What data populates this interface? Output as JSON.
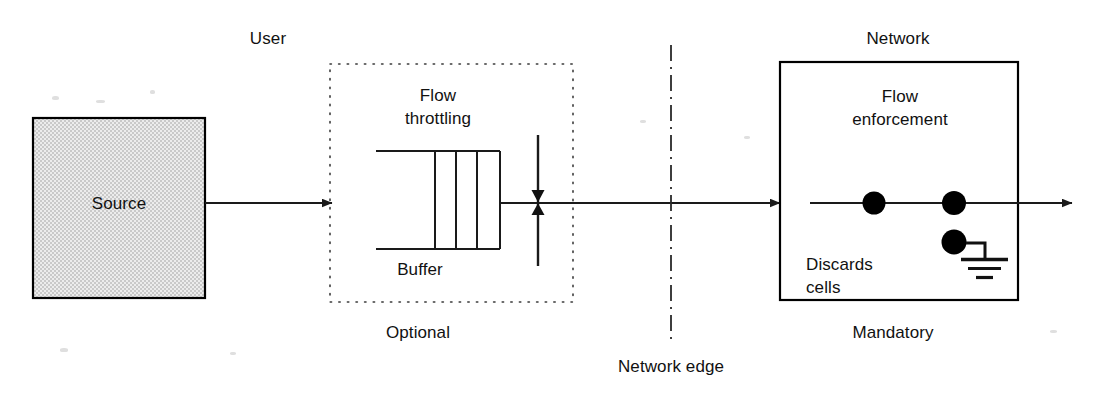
{
  "diagram": {
    "type": "block-flow-diagram",
    "colors": {
      "line": "#1a1a1a",
      "source_fill": "#d9d9d9",
      "source_border": "#000000",
      "cell_fill": "#000000",
      "background": "#ffffff"
    },
    "labels": {
      "user": "User",
      "network": "Network",
      "source": "Source",
      "flow_throttling": "Flow\nthrottling",
      "flow_throttling_line1": "Flow",
      "flow_throttling_line2": "throttling",
      "buffer": "Buffer",
      "optional": "Optional",
      "network_edge": "Network edge",
      "flow_enforcement_line1": "Flow",
      "flow_enforcement_line2": "enforcement",
      "discards_line1": "Discards",
      "discards_line2": "cells",
      "mandatory": "Mandatory"
    },
    "regions": [
      {
        "name": "user-region",
        "header": "User",
        "footer": "Optional",
        "border_style": "dotted",
        "contains": [
          "Flow throttling",
          "Buffer",
          "valve"
        ]
      },
      {
        "name": "network-region",
        "header": "Network",
        "footer": "Mandatory",
        "border_style": "solid",
        "contains": [
          "Flow enforcement",
          "Discards cells",
          "cells",
          "ground"
        ]
      }
    ],
    "buffer": {
      "cell_count": 3,
      "label": "Buffer"
    },
    "network_cells": {
      "on_line_count": 2,
      "discarded_count": 1
    },
    "icons": {
      "valve": "valve-icon",
      "ground": "ground-icon",
      "arrow": "arrowhead-icon",
      "cell": "cell-icon"
    }
  }
}
